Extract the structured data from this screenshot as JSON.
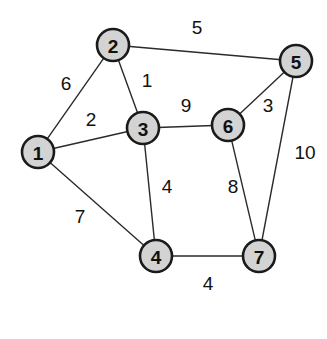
{
  "figure": {
    "caption": "",
    "background_color": "#ffffff",
    "node_fill_color": "#d3d3d3",
    "node_stroke_color": "#1a1a1a",
    "edge_color": "#2b2b2b",
    "label_color": "#111111"
  },
  "chart_data": {
    "type": "diagram",
    "xlabel": "",
    "ylabel": "",
    "layout": "node-link, straight edges, weighted",
    "node_radius": 16,
    "nodes": [
      {
        "id": "1",
        "label": "1",
        "x": 38,
        "y": 152
      },
      {
        "id": "2",
        "label": "2",
        "x": 113,
        "y": 45
      },
      {
        "id": "3",
        "label": "3",
        "x": 143,
        "y": 128
      },
      {
        "id": "4",
        "label": "4",
        "x": 156,
        "y": 256
      },
      {
        "id": "5",
        "label": "5",
        "x": 296,
        "y": 61
      },
      {
        "id": "6",
        "label": "6",
        "x": 228,
        "y": 125
      },
      {
        "id": "7",
        "label": "7",
        "x": 259,
        "y": 256
      }
    ],
    "edges": [
      {
        "source": "1",
        "target": "2",
        "weight": 6,
        "label": "6",
        "label_x": 66,
        "label_y": 83
      },
      {
        "source": "1",
        "target": "3",
        "weight": 2,
        "label": "2",
        "label_x": 91,
        "label_y": 119
      },
      {
        "source": "1",
        "target": "4",
        "weight": 7,
        "label": "7",
        "label_x": 80,
        "label_y": 216
      },
      {
        "source": "2",
        "target": "3",
        "weight": 1,
        "label": "1",
        "label_x": 147,
        "label_y": 80
      },
      {
        "source": "2",
        "target": "5",
        "weight": 5,
        "label": "5",
        "label_x": 197,
        "label_y": 27
      },
      {
        "source": "3",
        "target": "6",
        "weight": 9,
        "label": "9",
        "label_x": 186,
        "label_y": 105
      },
      {
        "source": "3",
        "target": "4",
        "weight": 4,
        "label": "4",
        "label_x": 167,
        "label_y": 186
      },
      {
        "source": "5",
        "target": "6",
        "weight": 3,
        "label": "3",
        "label_x": 268,
        "label_y": 105
      },
      {
        "source": "5",
        "target": "7",
        "weight": 10,
        "label": "10",
        "label_x": 305,
        "label_y": 152
      },
      {
        "source": "6",
        "target": "7",
        "weight": 8,
        "label": "8",
        "label_x": 233,
        "label_y": 186
      },
      {
        "source": "4",
        "target": "7",
        "weight": 4,
        "label": "4",
        "label_x": 208,
        "label_y": 283
      }
    ]
  }
}
